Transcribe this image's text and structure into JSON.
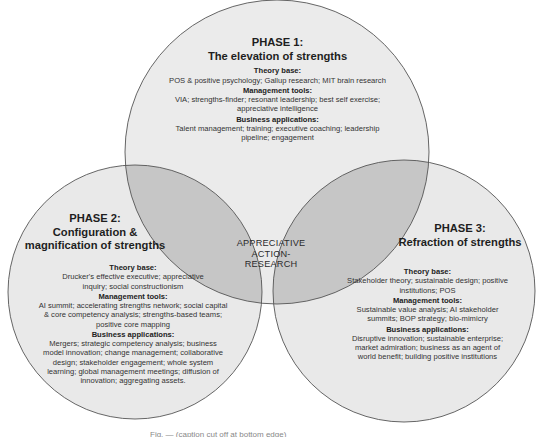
{
  "diagram": {
    "type": "venn",
    "colors": {
      "circle_fill": "#e9e9e9",
      "pair_overlap_fill": "#c4c4c4",
      "triple_overlap_fill": "#8f8f8f",
      "stroke": "#555555"
    },
    "center": {
      "lines": [
        "APPRECIATIVE",
        "ACTION-",
        "RESEARCH"
      ]
    },
    "phases": [
      {
        "title_line1": "PHASE 1:",
        "title_line2": "The elevation of strengths",
        "theory_base_label": "Theory base:",
        "theory_base": "POS & positive psychology; Gallup research; MIT brain research",
        "management_tools_label": "Management tools:",
        "management_tools": "VIA; strengths-finder; resonant leadership; best self exercise; appreciative intelligence",
        "business_applications_label": "Business applications:",
        "business_applications": "Talent management; training; executive coaching; leadership pipeline; engagement"
      },
      {
        "title_line1": "PHASE 2:",
        "title_line2": "Configuration &",
        "title_line3": "magnification of strengths",
        "theory_base_label": "Theory base:",
        "theory_base": "Drucker's effective executive; appreciative inquiry; social constructionism",
        "management_tools_label": "Management tools:",
        "management_tools": "AI summit; accelerating strengths network; social capital & core competency analysis; strengths-based teams; positive core mapping",
        "business_applications_label": "Business applications:",
        "business_applications": "Mergers; strategic competency analysis; business model innovation; change management; collaborative design; stakeholder engagement; whole system learning; global management meetings; diffusion of innovation; aggregating assets."
      },
      {
        "title_line1": "PHASE 3:",
        "title_line2": "Refraction of strengths",
        "theory_base_label": "Theory base:",
        "theory_base": "Stakeholder theory; sustainable design; positive institutions; POS",
        "management_tools_label": "Management tools:",
        "management_tools": "Sustainable value analysis; AI stakeholder summits; BOP strategy; bio-mimicry",
        "business_applications_label": "Business applications:",
        "business_applications": "Disruptive innovation; sustainable enterprise; market admiration; business as an agent of world benefit; building positive institutions"
      }
    ],
    "caption_partial": "Fig. — (caption cut off at bottom edge)"
  }
}
